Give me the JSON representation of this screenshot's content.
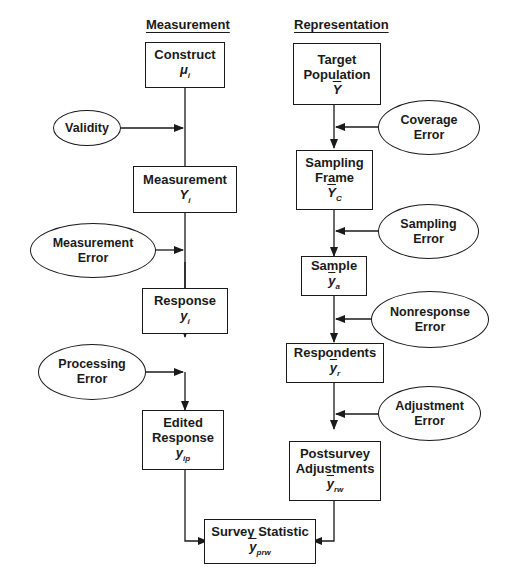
{
  "headings": {
    "measurement": "Measurement",
    "representation": "Representation"
  },
  "measurement_column": {
    "boxes": [
      {
        "label": "Construct",
        "symbol": "μ",
        "subscript": "i"
      },
      {
        "label": "Measurement",
        "symbol": "Y",
        "subscript": "i"
      },
      {
        "label": "Response",
        "symbol": "y",
        "subscript": "i"
      },
      {
        "label_line1": "Edited",
        "label_line2": "Response",
        "symbol": "y",
        "subscript": "ip"
      }
    ],
    "errors": [
      {
        "label": "Validity"
      },
      {
        "line1": "Measurement",
        "line2": "Error"
      },
      {
        "line1": "Processing",
        "line2": "Error"
      }
    ]
  },
  "representation_column": {
    "boxes": [
      {
        "line1": "Target",
        "line2": "Population",
        "symbol": "Y",
        "subscript": ""
      },
      {
        "line1": "Sampling",
        "line2": "Frame",
        "symbol": "Y",
        "subscript": "C"
      },
      {
        "label": "Sample",
        "symbol": "y",
        "subscript": "a"
      },
      {
        "label": "Respondents",
        "symbol": "y",
        "subscript": "r"
      },
      {
        "line1": "Postsurvey",
        "line2": "Adjustments",
        "symbol": "y",
        "subscript": "rw"
      }
    ],
    "errors": [
      {
        "line1": "Coverage",
        "line2": "Error"
      },
      {
        "line1": "Sampling",
        "line2": "Error"
      },
      {
        "line1": "Nonresponse",
        "line2": "Error"
      },
      {
        "line1": "Adjustment",
        "line2": "Error"
      }
    ]
  },
  "final": {
    "label": "Survey Statistic",
    "symbol": "y",
    "subscript": "prw"
  }
}
